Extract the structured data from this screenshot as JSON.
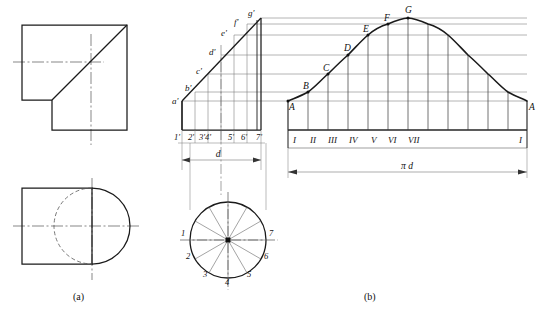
{
  "figure": {
    "captions": [
      {
        "key": "a",
        "text": "(a)",
        "x": 120,
        "y": 300
      },
      {
        "key": "b",
        "text": "(b)",
        "x": 370,
        "y": 300
      }
    ],
    "line_colors": {
      "outline": "#1a1a1a",
      "thin": "#555555",
      "center": "#444444",
      "hidden": "#555555",
      "projection": "#666666",
      "grid": "#777777"
    }
  },
  "view_top": {
    "name": "orthographic-top-view",
    "description": "L-shaped square profile with diagonal cut line and centre lines",
    "rect": {
      "x": 22,
      "y": 25,
      "width": 105,
      "height": 105
    },
    "notch": {
      "x": 52,
      "y": 100,
      "width": 75,
      "height": 30
    },
    "diagonal": {
      "x1": 52,
      "y1": 100,
      "x2": 127,
      "y2": 25
    },
    "centerline_h": {
      "x1": 13,
      "y1": 62,
      "x2": 100,
      "y2": 62
    },
    "centerline_v": {
      "x1": 91,
      "y1": 35,
      "x2": 91,
      "y2": 142
    }
  },
  "view_bottom": {
    "name": "orthographic-bottom-view",
    "description": "Rectangle with circle, hidden arc at left",
    "rect": {
      "x": 22,
      "y": 188,
      "width": 70,
      "height": 95
    },
    "circle": {
      "cx": 92,
      "cy": 226,
      "r": 40
    },
    "centerline_h": {
      "x1": 13,
      "y1": 226,
      "x2": 136,
      "y2": 226
    },
    "centerline_v": {
      "x1": 92,
      "y1": 178,
      "x2": 92,
      "y2": 278
    }
  },
  "front_view": {
    "name": "front-view-truncated-cylinder",
    "box": {
      "left": 182,
      "right": 261,
      "top": 18,
      "bottom": 130
    },
    "cut_line_label": "oblique cut a'-g'",
    "surface_points": [
      {
        "label": "a'",
        "x": 176,
        "y": 101,
        "px": 182,
        "py": 101
      },
      {
        "label": "b'",
        "x": 186,
        "y": 92,
        "px": 195,
        "py": 92
      },
      {
        "label": "c'",
        "x": 196,
        "y": 74,
        "px": 208,
        "py": 74
      },
      {
        "label": "d'",
        "x": 209,
        "y": 55,
        "px": 221,
        "py": 55
      },
      {
        "label": "e'",
        "x": 221,
        "y": 35,
        "px": 234,
        "py": 35
      },
      {
        "label": "f'",
        "x": 233,
        "y": 24,
        "px": 247,
        "py": 24
      },
      {
        "label": "g'",
        "x": 244,
        "y": 16,
        "px": 261,
        "py": 18
      }
    ],
    "base_ticks": [
      {
        "label": "1'",
        "x": 182
      },
      {
        "label": "2'",
        "x": 195
      },
      {
        "label": "3'",
        "x": 208
      },
      {
        "label": "4'",
        "x": 221
      },
      {
        "label": "5'",
        "x": 234
      },
      {
        "label": "6'",
        "x": 247
      },
      {
        "label": "7'",
        "x": 261
      }
    ],
    "base_tick_text": [
      "1'",
      "2'",
      "3'4'",
      "5'",
      "6'",
      "7'"
    ],
    "dimension": {
      "label": "d",
      "x1": 182,
      "x2": 240,
      "y": 158
    }
  },
  "division_circle": {
    "name": "division-circle-bottom",
    "cx": 228,
    "cy": 240,
    "r": 38,
    "divisions": 12,
    "labels": [
      {
        "text": "1",
        "x": 185,
        "y": 233
      },
      {
        "text": "2",
        "x": 189,
        "y": 257
      },
      {
        "text": "3",
        "x": 205,
        "y": 275
      },
      {
        "text": "4",
        "x": 227,
        "y": 282
      },
      {
        "text": "5",
        "x": 249,
        "y": 275
      },
      {
        "text": "6",
        "x": 265,
        "y": 257
      },
      {
        "text": "7",
        "x": 269,
        "y": 233
      }
    ]
  },
  "development": {
    "name": "developed-surface-diagram",
    "box": {
      "left": 288,
      "right": 527,
      "top": 14,
      "bottom": 130
    },
    "baseline_y": 130,
    "curve_points": [
      {
        "label": "A",
        "x": 288,
        "y": 101
      },
      {
        "label": "B",
        "x": 308,
        "y": 92
      },
      {
        "label": "C",
        "x": 328,
        "y": 74
      },
      {
        "label": "D",
        "x": 348,
        "y": 55
      },
      {
        "label": "E",
        "x": 368,
        "y": 35
      },
      {
        "label": "F",
        "x": 388,
        "y": 24
      },
      {
        "label": "G",
        "x": 408,
        "y": 18
      },
      {
        "label": "",
        "x": 428,
        "y": 24
      },
      {
        "label": "",
        "x": 448,
        "y": 35
      },
      {
        "label": "",
        "x": 468,
        "y": 55
      },
      {
        "label": "",
        "x": 488,
        "y": 74
      },
      {
        "label": "",
        "x": 508,
        "y": 92
      },
      {
        "label": "A",
        "x": 527,
        "y": 101
      }
    ],
    "curve_label_left": "A",
    "curve_label_right": "A",
    "apex_label": "G",
    "vertical_grid_count": 13,
    "horizontal_grid_levels": [
      101,
      92,
      74,
      55,
      35,
      24,
      18
    ],
    "roman_ticks": [
      {
        "label": "I",
        "x": 290
      },
      {
        "label": "II",
        "x": 310
      },
      {
        "label": "III",
        "x": 330
      },
      {
        "label": "IV",
        "x": 350
      },
      {
        "label": "V",
        "x": 370
      },
      {
        "label": "VI",
        "x": 390
      },
      {
        "label": "VII",
        "x": 410
      }
    ],
    "roman_last": {
      "label": "I",
      "x": 524
    },
    "dimension": {
      "label": "π d",
      "x1": 288,
      "x2": 527,
      "y": 170
    }
  },
  "projection_lines": {
    "name": "projection-lines",
    "from_x": 182,
    "to_x": 527,
    "levels": [
      101,
      92,
      74,
      55,
      35,
      24,
      18
    ]
  }
}
